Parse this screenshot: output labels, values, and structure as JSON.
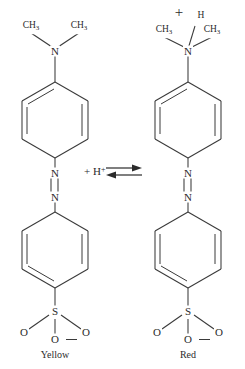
{
  "diagram": {
    "reagent": "+ H",
    "reagent_charge": "+",
    "arrow_type": "equilibrium-double-harpoon"
  },
  "left_structure": {
    "name": "methyl-orange-basic-form",
    "color_label": "Yellow",
    "amine_nitrogen": "N",
    "methyl_left": "CH",
    "methyl_left_sub": "3",
    "methyl_right": "CH",
    "methyl_right_sub": "3",
    "azo_nitrogen_top": "N",
    "azo_nitrogen_bottom": "N",
    "sulfur": "S",
    "oxygen_left": "O",
    "oxygen_right": "O",
    "oxygen_bottom": "O",
    "oxygen_bottom_charge": "minus"
  },
  "right_structure": {
    "name": "methyl-orange-acidic-form",
    "color_label": "Red",
    "ammonium_charge": "+",
    "ammonium_hydrogen": "H",
    "ammonium_nitrogen": "N",
    "methyl_left": "CH",
    "methyl_left_sub": "3",
    "methyl_right": "CH",
    "methyl_right_sub": "3",
    "azo_nitrogen_top": "N",
    "azo_nitrogen_bottom": "N",
    "sulfur": "S",
    "oxygen_left": "O",
    "oxygen_right": "O",
    "oxygen_bottom": "O",
    "oxygen_bottom_charge": "minus"
  },
  "colors": {
    "ink": "#2b2b2b",
    "bond": "#3a3a3a",
    "background": "#ffffff"
  }
}
